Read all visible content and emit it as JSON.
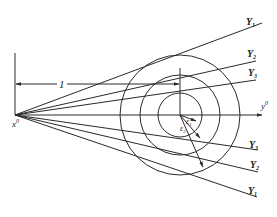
{
  "diagram": {
    "origin_label": "x",
    "origin_sup": "0",
    "axis_label": "y",
    "axis_sup": "0",
    "dimension_label": "1",
    "upper_lines": [
      {
        "label": "Y",
        "sub": "1"
      },
      {
        "label": "Y",
        "sub": "2"
      },
      {
        "label": "Y",
        "sub": "3"
      }
    ],
    "lower_lines": [
      {
        "label": "Y",
        "sub": "3"
      },
      {
        "label": "Y",
        "sub": "2"
      },
      {
        "label": "Y",
        "sub": "1"
      }
    ],
    "epsilon_labels": [
      {
        "label": "ε",
        "sub": "1"
      },
      {
        "label": "ε",
        "sub": "2"
      }
    ],
    "circles": [
      {
        "name": "inner",
        "radius": 22
      },
      {
        "name": "middle",
        "radius": 40
      },
      {
        "name": "outer",
        "radius": 60
      }
    ],
    "line_color": "#2a2a2a"
  }
}
